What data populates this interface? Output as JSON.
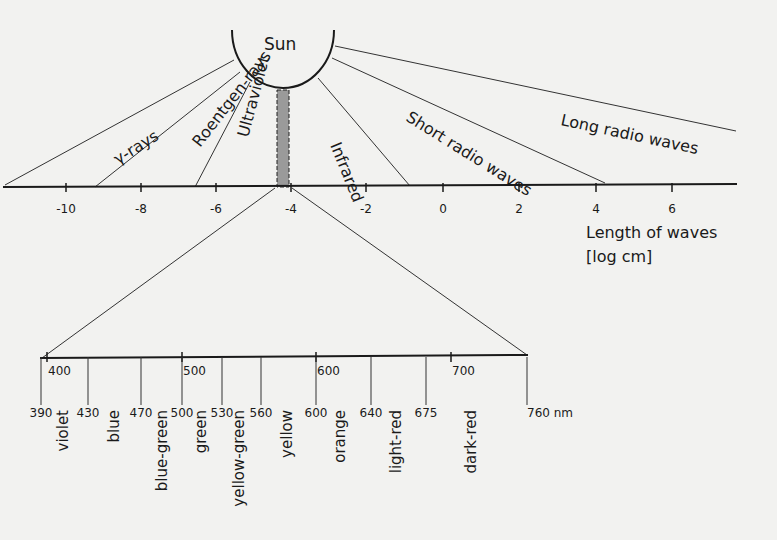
{
  "diagram": {
    "sun_label": "Sun",
    "bands": [
      {
        "label": "γ-rays",
        "x": 118,
        "y": 165,
        "rot": -32
      },
      {
        "label": "Roentgen-rays",
        "x": 200,
        "y": 148,
        "rot": -52
      },
      {
        "label": "Ultraviolet",
        "x": 248,
        "y": 138,
        "rot": -75
      },
      {
        "label": "Infrared",
        "x": 330,
        "y": 145,
        "rot": 68
      },
      {
        "label": "Short radio waves",
        "x": 405,
        "y": 120,
        "rot": 32
      },
      {
        "label": "Long radio waves",
        "x": 560,
        "y": 125,
        "rot": 12
      }
    ],
    "log_axis": {
      "ticks": [
        {
          "label": "-10",
          "x": 66
        },
        {
          "label": "-8",
          "x": 141
        },
        {
          "label": "-6",
          "x": 216
        },
        {
          "label": "-4",
          "x": 291
        },
        {
          "label": "-2",
          "x": 366
        },
        {
          "label": "0",
          "x": 443
        },
        {
          "label": "2",
          "x": 519
        },
        {
          "label": "4",
          "x": 596
        },
        {
          "label": "6",
          "x": 672
        }
      ],
      "title_line1": "Length of waves",
      "title_line2": "[log cm]"
    },
    "visible_axis": {
      "top_ticks": [
        {
          "label": "400",
          "x": 47
        },
        {
          "label": "500",
          "x": 182
        },
        {
          "label": "600",
          "x": 316
        },
        {
          "label": "700",
          "x": 451
        }
      ],
      "boundaries": [
        {
          "label": "390",
          "x": 41
        },
        {
          "label": "430",
          "x": 88
        },
        {
          "label": "470",
          "x": 141
        },
        {
          "label": "500",
          "x": 182
        },
        {
          "label": "530",
          "x": 222
        },
        {
          "label": "560",
          "x": 261
        },
        {
          "label": "600",
          "x": 316
        },
        {
          "label": "640",
          "x": 371
        },
        {
          "label": "675",
          "x": 426
        },
        {
          "label": "760",
          "x": 527
        }
      ],
      "unit": "nm",
      "colors": [
        {
          "label": "violet",
          "x": 68
        },
        {
          "label": "blue",
          "x": 119
        },
        {
          "label": "blue-green",
          "x": 167
        },
        {
          "label": "green",
          "x": 206
        },
        {
          "label": "yellow-green",
          "x": 244
        },
        {
          "label": "yellow",
          "x": 292
        },
        {
          "label": "orange",
          "x": 345
        },
        {
          "label": "light-red",
          "x": 401
        },
        {
          "label": "dark-red",
          "x": 476
        }
      ]
    }
  }
}
